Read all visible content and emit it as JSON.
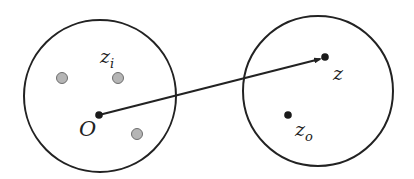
{
  "diagram": {
    "left_region": {
      "center": [
        100,
        96
      ],
      "radius": 76,
      "origin_label": "O",
      "origin_point": [
        99,
        115
      ],
      "inner_points_label": "z",
      "inner_points_label_sub": "i",
      "inner_points": [
        [
          62,
          78
        ],
        [
          118,
          78
        ],
        [
          137,
          134
        ]
      ]
    },
    "right_region": {
      "center": [
        318,
        91
      ],
      "radius": 75,
      "target_label": "z",
      "target_point": [
        325,
        57
      ],
      "other_label": "z",
      "other_label_sub": "o",
      "other_point": [
        288,
        115
      ]
    },
    "vector": {
      "from": "O",
      "to": "z"
    },
    "colors": {
      "stroke": "#222222",
      "gray_point_fill": "#b5b5b5",
      "gray_point_stroke": "#6e6e6e",
      "dark_point": "#1a1a1a"
    }
  }
}
